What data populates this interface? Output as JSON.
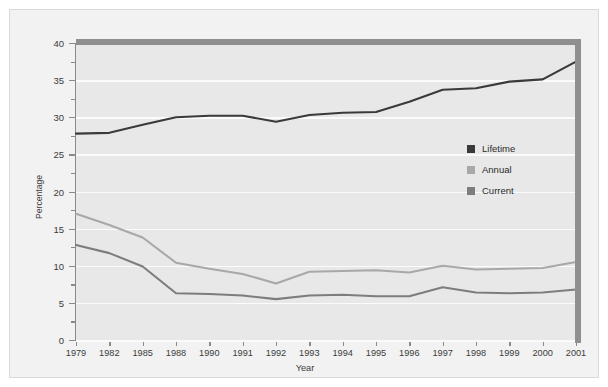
{
  "chart_data": {
    "type": "line",
    "title": "",
    "xlabel": "Year",
    "ylabel": "Percentage",
    "categories": [
      "1979",
      "1982",
      "1985",
      "1988",
      "1990",
      "1991",
      "1992",
      "1993",
      "1994",
      "1995",
      "1996",
      "1997",
      "1998",
      "1999",
      "2000",
      "2001"
    ],
    "ylim": [
      0,
      40
    ],
    "yticks": [
      0,
      5,
      10,
      15,
      20,
      25,
      30,
      35,
      40
    ],
    "ytick_labels": [
      "0",
      "5",
      "10",
      "15",
      "20",
      "25",
      "30",
      "35",
      "40"
    ],
    "grid": "horizontal",
    "legend_position": "center-right",
    "series": [
      {
        "name": "Lifetime",
        "color": "#3a3a3a",
        "values": [
          27.8,
          27.9,
          29.0,
          30.0,
          30.2,
          30.2,
          29.4,
          30.3,
          30.6,
          30.7,
          32.1,
          33.7,
          33.9,
          34.8,
          35.1,
          37.5
        ]
      },
      {
        "name": "Annual",
        "color": "#a8a8a8",
        "values": [
          17.0,
          15.5,
          13.8,
          10.4,
          9.6,
          8.9,
          7.6,
          9.2,
          9.3,
          9.4,
          9.1,
          10.0,
          9.5,
          9.6,
          9.7,
          10.5
        ]
      },
      {
        "name": "Current",
        "color": "#7d7d7d",
        "values": [
          12.8,
          11.7,
          9.9,
          6.3,
          6.2,
          6.0,
          5.5,
          6.0,
          6.1,
          5.9,
          5.9,
          7.1,
          6.4,
          6.3,
          6.4,
          6.8
        ]
      }
    ]
  },
  "legend": {
    "items": [
      {
        "label": "Lifetime",
        "color": "#3a3a3a"
      },
      {
        "label": "Annual",
        "color": "#a8a8a8"
      },
      {
        "label": "Current",
        "color": "#7d7d7d"
      }
    ]
  },
  "colors": {
    "figure_background": "#f2f2f2",
    "plot_background": "#e8e8e8",
    "gridline": "#fbfbfb",
    "frame": "#8f8f8f",
    "axis": "#8a8a8a",
    "text": "#3b3b3b"
  }
}
